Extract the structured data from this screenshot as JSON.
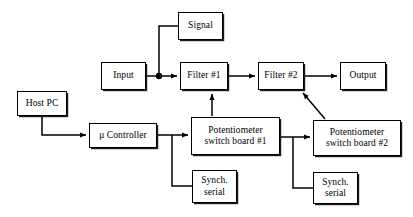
{
  "diagram": {
    "background_color": "#ffffff",
    "line_color": "#000000",
    "box_fill": "#ffffff",
    "nodes": [
      {
        "id": "signal",
        "label": "Signal",
        "x": 178,
        "y": 12,
        "w": 45,
        "h": 28
      },
      {
        "id": "input",
        "label": "Input",
        "x": 101,
        "y": 62,
        "w": 45,
        "h": 28
      },
      {
        "id": "filter1",
        "label": "Filter #1",
        "x": 180,
        "y": 62,
        "w": 48,
        "h": 28
      },
      {
        "id": "filter2",
        "label": "Filter #2",
        "x": 258,
        "y": 62,
        "w": 46,
        "h": 28
      },
      {
        "id": "output",
        "label": "Output",
        "x": 340,
        "y": 62,
        "w": 46,
        "h": 28
      },
      {
        "id": "host-pc",
        "label": "Host PC",
        "x": 17,
        "y": 91,
        "w": 50,
        "h": 25
      },
      {
        "id": "micro-controller",
        "label": "μ Controller",
        "x": 89,
        "y": 123,
        "w": 68,
        "h": 25
      },
      {
        "id": "pot-board-1",
        "label": "Potentiometer\nswitch board #1",
        "x": 191,
        "y": 117,
        "w": 89,
        "h": 38
      },
      {
        "id": "pot-board-2",
        "label": "Potentiometer\nswitch board #2",
        "x": 313,
        "y": 120,
        "w": 88,
        "h": 36
      },
      {
        "id": "synch-serial-1",
        "label": "Synch.\nserial",
        "x": 192,
        "y": 170,
        "w": 45,
        "h": 33
      },
      {
        "id": "synch-serial-2",
        "label": "Synch.\nserial",
        "x": 313,
        "y": 172,
        "w": 45,
        "h": 32
      }
    ],
    "connections": [
      {
        "id": "input-to-junction",
        "from": "input",
        "to": "signal-junction",
        "arrow": false
      },
      {
        "id": "junction-to-signal",
        "from": "signal-junction",
        "to": "signal",
        "arrow": false
      },
      {
        "id": "junction-to-filter1",
        "from": "signal-junction",
        "to": "filter1",
        "arrow": true
      },
      {
        "id": "filter1-to-filter2",
        "from": "filter1",
        "to": "filter2",
        "arrow": true
      },
      {
        "id": "filter2-to-output",
        "from": "filter2",
        "to": "output",
        "arrow": true
      },
      {
        "id": "hostpc-to-controller",
        "from": "host-pc",
        "to": "micro-controller",
        "arrow": true
      },
      {
        "id": "controller-to-board1",
        "from": "micro-controller",
        "to": "pot-board-1",
        "arrow": true
      },
      {
        "id": "controller-to-synch1",
        "from": "micro-controller",
        "to": "synch-serial-1",
        "arrow": false
      },
      {
        "id": "board1-to-filter1",
        "from": "pot-board-1",
        "to": "filter1",
        "arrow": true
      },
      {
        "id": "board1-to-board2",
        "from": "pot-board-1",
        "to": "pot-board-2",
        "arrow": true
      },
      {
        "id": "board1-to-synch2",
        "from": "pot-board-1",
        "to": "synch-serial-2",
        "arrow": false
      },
      {
        "id": "board2-to-filter2",
        "from": "pot-board-2",
        "to": "filter2",
        "arrow": true
      }
    ],
    "junctions": [
      {
        "id": "signal-junction",
        "x": 159,
        "y": 76,
        "dot": true
      },
      {
        "id": "controller-branch",
        "x": 172,
        "y": 135,
        "dot": false
      },
      {
        "id": "board1-branch",
        "x": 293,
        "y": 137,
        "dot": false
      }
    ]
  }
}
